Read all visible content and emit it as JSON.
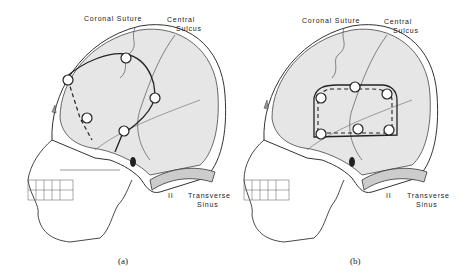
{
  "figure": {
    "panels": [
      {
        "id": "a",
        "caption": "(a)",
        "labels": {
          "coronal_suture": "Coronal Suture",
          "central_sulcus_line1": "Central",
          "central_sulcus_line2": "Sulcus",
          "transverse_sinus_line1": "Transverse",
          "transverse_sinus_line2": "Sinus",
          "small_mark": "II"
        },
        "burr_holes": 5,
        "flap_shape": "question-mark"
      },
      {
        "id": "b",
        "caption": "(b)",
        "labels": {
          "coronal_suture": "Coronal Suture",
          "central_sulcus_line1": "Central",
          "central_sulcus_line2": "Sulcus",
          "transverse_sinus_line1": "Transverse",
          "transverse_sinus_line2": "Sinus",
          "small_mark": "II"
        },
        "burr_holes": 6,
        "flap_shape": "rectangular"
      }
    ],
    "colors": {
      "line": "#333333",
      "brain_fill": "#e6e6e6",
      "background": "#ffffff"
    }
  }
}
